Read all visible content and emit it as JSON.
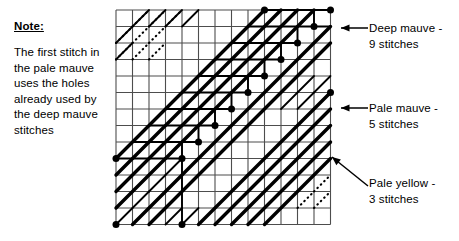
{
  "note": {
    "title": "Note:",
    "body": "The first stitch in the pale mauve uses the holes already used by the deep mauve stitches"
  },
  "legend": [
    {
      "key": "deep_mauve",
      "label": "Deep mauve -\n9 stitches",
      "stitches": 9,
      "style": "thick-solid-diagonal"
    },
    {
      "key": "pale_mauve",
      "label": "Pale mauve -\n5 stitches",
      "stitches": 5,
      "style": "medium-solid-diagonal"
    },
    {
      "key": "pale_yellow",
      "label": "Pale yellow -\n3 stitches",
      "stitches": 3,
      "style": "dotted-diagonal"
    }
  ],
  "colors": {
    "ink": "#000000",
    "grid": "#4d4d4d",
    "paper": "#ffffff"
  },
  "chart_data": {
    "type": "grid-chart",
    "title": "",
    "grid": {
      "x0": 116,
      "y0": 10,
      "cell": 16.5,
      "cols": 13,
      "rows": 13,
      "line_color": "#4d4d4d",
      "line_width": 1.1
    },
    "long_stitches_deep": [
      {
        "x1": 0,
        "y1": 9,
        "x2": 9,
        "y2": 0
      },
      {
        "x1": 0,
        "y1": 10,
        "x2": 10,
        "y2": 0
      },
      {
        "x1": 0,
        "y1": 11,
        "x2": 11,
        "y2": 0
      },
      {
        "x1": 0,
        "y1": 12,
        "x2": 12,
        "y2": 0
      },
      {
        "x1": 1,
        "y1": 13,
        "x2": 13,
        "y2": 1
      },
      {
        "x1": 2,
        "y1": 13,
        "x2": 13,
        "y2": 2
      }
    ],
    "long_stitches_pale_mauve": [
      {
        "x1": 5,
        "y1": 13,
        "x2": 13,
        "y2": 5
      },
      {
        "x1": 6,
        "y1": 13,
        "x2": 13,
        "y2": 6
      },
      {
        "x1": 7,
        "y1": 13,
        "x2": 13,
        "y2": 7
      },
      {
        "x1": 8,
        "y1": 13,
        "x2": 13,
        "y2": 8
      },
      {
        "x1": 9,
        "y1": 13,
        "x2": 13,
        "y2": 9
      }
    ],
    "short_stitches_thin": [
      {
        "x1": 0,
        "y1": 2,
        "x2": 1,
        "y2": 1
      },
      {
        "x1": 0,
        "y1": 3,
        "x2": 1,
        "y2": 2
      },
      {
        "x1": 1,
        "y1": 1,
        "x2": 2,
        "y2": 0
      },
      {
        "x1": 2,
        "y1": 1,
        "x2": 3,
        "y2": 0
      },
      {
        "x1": 3,
        "y1": 1,
        "x2": 4,
        "y2": 0
      },
      {
        "x1": 4,
        "y1": 1,
        "x2": 5,
        "y2": 0
      },
      {
        "x1": 0,
        "y1": 9,
        "x2": 1,
        "y2": 8
      },
      {
        "x1": 1,
        "y1": 9,
        "x2": 2,
        "y2": 8
      },
      {
        "x1": 2,
        "y1": 9,
        "x2": 3,
        "y2": 8
      },
      {
        "x1": 3,
        "y1": 9,
        "x2": 4,
        "y2": 8
      },
      {
        "x1": 0,
        "y1": 10,
        "x2": 1,
        "y2": 9
      },
      {
        "x1": 1,
        "y1": 10,
        "x2": 2,
        "y2": 9
      },
      {
        "x1": 2,
        "y1": 10,
        "x2": 3,
        "y2": 9
      },
      {
        "x1": 3,
        "y1": 10,
        "x2": 4,
        "y2": 9
      },
      {
        "x1": 0,
        "y1": 11,
        "x2": 1,
        "y2": 10
      },
      {
        "x1": 1,
        "y1": 11,
        "x2": 2,
        "y2": 10
      },
      {
        "x1": 2,
        "y1": 11,
        "x2": 3,
        "y2": 10
      },
      {
        "x1": 3,
        "y1": 11,
        "x2": 4,
        "y2": 10
      },
      {
        "x1": 0,
        "y1": 12,
        "x2": 1,
        "y2": 11
      },
      {
        "x1": 1,
        "y1": 12,
        "x2": 2,
        "y2": 11
      },
      {
        "x1": 2,
        "y1": 12,
        "x2": 3,
        "y2": 11
      },
      {
        "x1": 3,
        "y1": 12,
        "x2": 4,
        "y2": 11
      },
      {
        "x1": 0,
        "y1": 13,
        "x2": 1,
        "y2": 12
      },
      {
        "x1": 1,
        "y1": 13,
        "x2": 2,
        "y2": 12
      },
      {
        "x1": 2,
        "y1": 13,
        "x2": 3,
        "y2": 12
      },
      {
        "x1": 3,
        "y1": 13,
        "x2": 4,
        "y2": 12
      },
      {
        "x1": 4,
        "y1": 13,
        "x2": 5,
        "y2": 12
      },
      {
        "x1": 6,
        "y1": 13,
        "x2": 7,
        "y2": 12
      },
      {
        "x1": 7,
        "y1": 13,
        "x2": 8,
        "y2": 12
      },
      {
        "x1": 8,
        "y1": 13,
        "x2": 9,
        "y2": 12
      },
      {
        "x1": 10,
        "y1": 5,
        "x2": 11,
        "y2": 4
      },
      {
        "x1": 11,
        "y1": 5,
        "x2": 12,
        "y2": 4
      },
      {
        "x1": 12,
        "y1": 5,
        "x2": 13,
        "y2": 4
      },
      {
        "x1": 10,
        "y1": 6,
        "x2": 11,
        "y2": 5
      },
      {
        "x1": 11,
        "y1": 6,
        "x2": 12,
        "y2": 5
      },
      {
        "x1": 12,
        "y1": 6,
        "x2": 13,
        "y2": 5
      },
      {
        "x1": 11,
        "y1": 7,
        "x2": 12,
        "y2": 6
      },
      {
        "x1": 12,
        "y1": 7,
        "x2": 13,
        "y2": 6
      },
      {
        "x1": 12,
        "y1": 8,
        "x2": 13,
        "y2": 7
      }
    ],
    "dotted_stitches": [
      {
        "x1": 0,
        "y1": 2,
        "x2": 1,
        "y2": 1
      },
      {
        "x1": 0,
        "y1": 3,
        "x2": 1,
        "y2": 2
      },
      {
        "x1": 1,
        "y1": 2,
        "x2": 2,
        "y2": 1
      },
      {
        "x1": 1,
        "y1": 3,
        "x2": 2,
        "y2": 2
      },
      {
        "x1": 2,
        "y1": 2,
        "x2": 3,
        "y2": 1
      },
      {
        "x1": 2,
        "y1": 3,
        "x2": 3,
        "y2": 2
      },
      {
        "x1": 1,
        "y1": 1,
        "x2": 2,
        "y2": 0
      },
      {
        "x1": 2,
        "y1": 1,
        "x2": 3,
        "y2": 0
      },
      {
        "x1": 3,
        "y1": 1,
        "x2": 4,
        "y2": 0
      },
      {
        "x1": 10,
        "y1": 10,
        "x2": 11,
        "y2": 9
      },
      {
        "x1": 11,
        "y1": 10,
        "x2": 12,
        "y2": 9
      },
      {
        "x1": 12,
        "y1": 10,
        "x2": 13,
        "y2": 9
      },
      {
        "x1": 10,
        "y1": 11,
        "x2": 11,
        "y2": 10
      },
      {
        "x1": 11,
        "y1": 11,
        "x2": 12,
        "y2": 10
      },
      {
        "x1": 12,
        "y1": 11,
        "x2": 13,
        "y2": 10
      },
      {
        "x1": 9,
        "y1": 12,
        "x2": 10,
        "y2": 11
      },
      {
        "x1": 10,
        "y1": 12,
        "x2": 11,
        "y2": 11
      },
      {
        "x1": 11,
        "y1": 12,
        "x2": 12,
        "y2": 11
      },
      {
        "x1": 12,
        "y1": 12,
        "x2": 13,
        "y2": 11
      }
    ],
    "backstitch_runs": [
      {
        "from": {
          "x": 13,
          "y": 0
        },
        "to": {
          "x": 9,
          "y": 0
        },
        "corner": null
      },
      {
        "from": {
          "x": 13,
          "y": 1
        },
        "to": {
          "x": 8,
          "y": 1
        },
        "corner": {
          "x": 8,
          "y": 1
        }
      },
      {
        "from": {
          "x": 12,
          "y": 1
        },
        "to": {
          "x": 12,
          "y": 0
        }
      },
      {
        "from": {
          "x": 11,
          "y": 2
        },
        "to": {
          "x": 7,
          "y": 2
        }
      },
      {
        "from": {
          "x": 11,
          "y": 2
        },
        "to": {
          "x": 11,
          "y": 1
        }
      },
      {
        "from": {
          "x": 10,
          "y": 3
        },
        "to": {
          "x": 6,
          "y": 3
        }
      },
      {
        "from": {
          "x": 10,
          "y": 3
        },
        "to": {
          "x": 10,
          "y": 2
        }
      },
      {
        "from": {
          "x": 9,
          "y": 4
        },
        "to": {
          "x": 5,
          "y": 4
        }
      },
      {
        "from": {
          "x": 9,
          "y": 4
        },
        "to": {
          "x": 9,
          "y": 3
        }
      },
      {
        "from": {
          "x": 8,
          "y": 5
        },
        "to": {
          "x": 4,
          "y": 5
        }
      },
      {
        "from": {
          "x": 8,
          "y": 5
        },
        "to": {
          "x": 8,
          "y": 4
        }
      },
      {
        "from": {
          "x": 7,
          "y": 6
        },
        "to": {
          "x": 3,
          "y": 6
        }
      },
      {
        "from": {
          "x": 7,
          "y": 6
        },
        "to": {
          "x": 7,
          "y": 5
        }
      },
      {
        "from": {
          "x": 6,
          "y": 7
        },
        "to": {
          "x": 2,
          "y": 7
        }
      },
      {
        "from": {
          "x": 6,
          "y": 7
        },
        "to": {
          "x": 6,
          "y": 6
        }
      },
      {
        "from": {
          "x": 5,
          "y": 8
        },
        "to": {
          "x": 1,
          "y": 8
        }
      },
      {
        "from": {
          "x": 5,
          "y": 8
        },
        "to": {
          "x": 5,
          "y": 7
        }
      },
      {
        "from": {
          "x": 4,
          "y": 9
        },
        "to": {
          "x": 0,
          "y": 9
        }
      },
      {
        "from": {
          "x": 4,
          "y": 13
        },
        "to": {
          "x": 4,
          "y": 8
        }
      }
    ],
    "knots": [
      {
        "x": 9,
        "y": 0
      },
      {
        "x": 13,
        "y": 0
      },
      {
        "x": 12,
        "y": 1
      },
      {
        "x": 11,
        "y": 2
      },
      {
        "x": 10,
        "y": 3
      },
      {
        "x": 9,
        "y": 4
      },
      {
        "x": 8,
        "y": 5
      },
      {
        "x": 7,
        "y": 6
      },
      {
        "x": 6,
        "y": 7
      },
      {
        "x": 5,
        "y": 8
      },
      {
        "x": 4,
        "y": 9
      },
      {
        "x": 0,
        "y": 9
      },
      {
        "x": 0,
        "y": 13
      },
      {
        "x": 4,
        "y": 13
      },
      {
        "x": 13,
        "y": 5
      }
    ],
    "callouts": [
      {
        "key": "deep_mauve",
        "arrow_from": {
          "x": 368,
          "y": 28
        },
        "arrow_to": {
          "x": 341,
          "y": 28
        }
      },
      {
        "key": "pale_mauve",
        "arrow_from": {
          "x": 368,
          "y": 108
        },
        "arrow_to": {
          "x": 341,
          "y": 108
        }
      },
      {
        "key": "pale_yellow",
        "arrow_from": {
          "x": 368,
          "y": 186
        },
        "arrow_to": {
          "x": 332,
          "y": 157
        }
      }
    ]
  }
}
